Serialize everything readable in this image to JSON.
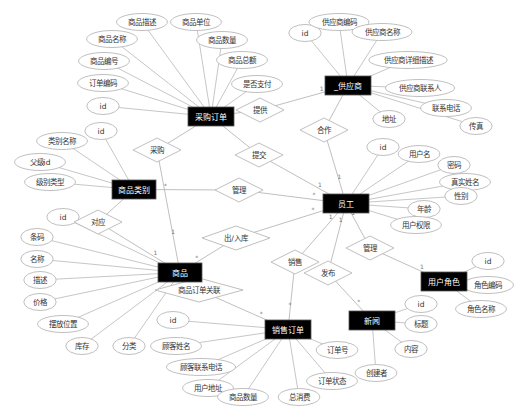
{
  "diagram": {
    "type": "er-diagram",
    "entities": [
      {
        "id": "purchase_order",
        "label": "采购订单",
        "x": 188,
        "y": 107,
        "w": 46,
        "h": 19
      },
      {
        "id": "supplier",
        "label": "_供应商",
        "x": 325,
        "y": 76,
        "w": 46,
        "h": 19
      },
      {
        "id": "category",
        "label": "商品类别",
        "x": 112,
        "y": 180,
        "w": 44,
        "h": 19
      },
      {
        "id": "employee",
        "label": "员工",
        "x": 323,
        "y": 194,
        "w": 46,
        "h": 19
      },
      {
        "id": "product",
        "label": "商品",
        "x": 158,
        "y": 263,
        "w": 44,
        "h": 19
      },
      {
        "id": "sales_order",
        "label": "销售订单",
        "x": 265,
        "y": 320,
        "w": 46,
        "h": 19
      },
      {
        "id": "news",
        "label": "新闻",
        "x": 349,
        "y": 311,
        "w": 46,
        "h": 19
      },
      {
        "id": "user_role",
        "label": "用户角色",
        "x": 421,
        "y": 272,
        "w": 46,
        "h": 19
      }
    ],
    "relationships": [
      {
        "id": "supply",
        "label": "提供",
        "x": 260,
        "y": 110
      },
      {
        "id": "cooperate",
        "label": "合作",
        "x": 324,
        "y": 130
      },
      {
        "id": "purchase",
        "label": "采购",
        "x": 157,
        "y": 150
      },
      {
        "id": "submit",
        "label": "提交",
        "x": 259,
        "y": 155
      },
      {
        "id": "manage1",
        "label": "管理",
        "x": 239,
        "y": 190
      },
      {
        "id": "correspond",
        "label": "对应",
        "x": 98,
        "y": 222
      },
      {
        "id": "stock",
        "label": "出/入库",
        "x": 236,
        "y": 238
      },
      {
        "id": "sell",
        "label": "销售",
        "x": 295,
        "y": 262
      },
      {
        "id": "publish",
        "label": "发布",
        "x": 328,
        "y": 273
      },
      {
        "id": "manage2",
        "label": "管理",
        "x": 370,
        "y": 248
      },
      {
        "id": "order_link",
        "label": "商品订单关联",
        "x": 199,
        "y": 290
      }
    ],
    "attributes": [
      {
        "entity": "purchase_order",
        "label": "商品描述",
        "x": 142,
        "y": 22
      },
      {
        "entity": "purchase_order",
        "label": "商品单位",
        "x": 196,
        "y": 22
      },
      {
        "entity": "purchase_order",
        "label": "商品名称",
        "x": 112,
        "y": 39
      },
      {
        "entity": "purchase_order",
        "label": "商品数量",
        "x": 222,
        "y": 40
      },
      {
        "entity": "purchase_order",
        "label": "商品编号",
        "x": 104,
        "y": 61
      },
      {
        "entity": "purchase_order",
        "label": "商品总额",
        "x": 242,
        "y": 60
      },
      {
        "entity": "purchase_order",
        "label": "订单编码",
        "x": 103,
        "y": 83
      },
      {
        "entity": "purchase_order",
        "label": "是否支付",
        "x": 257,
        "y": 84
      },
      {
        "entity": "purchase_order",
        "label": "id",
        "x": 103,
        "y": 106
      },
      {
        "entity": "supplier",
        "label": "id",
        "x": 305,
        "y": 33
      },
      {
        "entity": "supplier",
        "label": "供应商编码",
        "x": 339,
        "y": 22
      },
      {
        "entity": "supplier",
        "label": "供应商名称",
        "x": 382,
        "y": 32
      },
      {
        "entity": "supplier",
        "label": "供应商详细描述",
        "x": 408,
        "y": 60
      },
      {
        "entity": "supplier",
        "label": "供应商联系人",
        "x": 420,
        "y": 88
      },
      {
        "entity": "supplier",
        "label": "联系电话",
        "x": 446,
        "y": 108
      },
      {
        "entity": "supplier",
        "label": "传真",
        "x": 476,
        "y": 126
      },
      {
        "entity": "supplier",
        "label": "地址",
        "x": 389,
        "y": 119
      },
      {
        "entity": "category",
        "label": "id",
        "x": 101,
        "y": 131
      },
      {
        "entity": "category",
        "label": "类别名称",
        "x": 62,
        "y": 141
      },
      {
        "entity": "category",
        "label": "父级id",
        "x": 40,
        "y": 162
      },
      {
        "entity": "category",
        "label": "级别类型",
        "x": 50,
        "y": 182
      },
      {
        "entity": "employee",
        "label": "id",
        "x": 383,
        "y": 147
      },
      {
        "entity": "employee",
        "label": "用户名",
        "x": 419,
        "y": 154
      },
      {
        "entity": "employee",
        "label": "密码",
        "x": 454,
        "y": 165
      },
      {
        "entity": "employee",
        "label": "真实姓名",
        "x": 465,
        "y": 182
      },
      {
        "entity": "employee",
        "label": "性别",
        "x": 461,
        "y": 196
      },
      {
        "entity": "employee",
        "label": "年龄",
        "x": 424,
        "y": 209
      },
      {
        "entity": "employee",
        "label": "用户权限",
        "x": 416,
        "y": 225
      },
      {
        "entity": "product",
        "label": "id",
        "x": 63,
        "y": 217
      },
      {
        "entity": "product",
        "label": "条码",
        "x": 37,
        "y": 237
      },
      {
        "entity": "product",
        "label": "名称",
        "x": 37,
        "y": 259
      },
      {
        "entity": "product",
        "label": "描述",
        "x": 40,
        "y": 280
      },
      {
        "entity": "product",
        "label": "价格",
        "x": 40,
        "y": 302
      },
      {
        "entity": "product",
        "label": "摆放位置",
        "x": 63,
        "y": 324
      },
      {
        "entity": "product",
        "label": "库存",
        "x": 82,
        "y": 346
      },
      {
        "entity": "product",
        "label": "分类",
        "x": 129,
        "y": 346
      },
      {
        "entity": "sales_order",
        "label": "id",
        "x": 173,
        "y": 320
      },
      {
        "entity": "sales_order",
        "label": "顾客姓名",
        "x": 176,
        "y": 346
      },
      {
        "entity": "sales_order",
        "label": "顾客联系电话",
        "x": 201,
        "y": 367
      },
      {
        "entity": "sales_order",
        "label": "用户地址",
        "x": 208,
        "y": 388
      },
      {
        "entity": "sales_order",
        "label": "商品数量",
        "x": 243,
        "y": 397
      },
      {
        "entity": "sales_order",
        "label": "总消费",
        "x": 299,
        "y": 397
      },
      {
        "entity": "sales_order",
        "label": "订单号",
        "x": 337,
        "y": 350
      },
      {
        "entity": "sales_order",
        "label": "订单状态",
        "x": 332,
        "y": 381
      },
      {
        "entity": "news",
        "label": "id",
        "x": 421,
        "y": 304
      },
      {
        "entity": "news",
        "label": "标题",
        "x": 421,
        "y": 324
      },
      {
        "entity": "news",
        "label": "内容",
        "x": 411,
        "y": 349
      },
      {
        "entity": "news",
        "label": "创建者",
        "x": 376,
        "y": 373
      },
      {
        "entity": "user_role",
        "label": "id",
        "x": 488,
        "y": 261
      },
      {
        "entity": "user_role",
        "label": "角色编码",
        "x": 488,
        "y": 285
      },
      {
        "entity": "user_role",
        "label": "角色名称",
        "x": 481,
        "y": 309
      }
    ],
    "edges": [
      {
        "from": "purchase_order",
        "to": "supply",
        "from_card": "*",
        "to_card": ""
      },
      {
        "from": "supply",
        "to": "supplier",
        "from_card": "",
        "to_card": "1"
      },
      {
        "from": "supplier",
        "to": "cooperate",
        "from_card": "*",
        "to_card": ""
      },
      {
        "from": "cooperate",
        "to": "employee",
        "from_card": "",
        "to_card": "1"
      },
      {
        "from": "purchase_order",
        "to": "purchase",
        "from_card": "*",
        "to_card": ""
      },
      {
        "from": "purchase",
        "to": "product",
        "from_card": "",
        "to_card": "1"
      },
      {
        "from": "purchase_order",
        "to": "submit",
        "from_card": "*",
        "to_card": ""
      },
      {
        "from": "submit",
        "to": "employee",
        "from_card": "",
        "to_card": "1"
      },
      {
        "from": "category",
        "to": "manage1",
        "from_card": "*",
        "to_card": ""
      },
      {
        "from": "manage1",
        "to": "employee",
        "from_card": "",
        "to_card": "*"
      },
      {
        "from": "category",
        "to": "correspond",
        "from_card": "1",
        "to_card": ""
      },
      {
        "from": "correspond",
        "to": "product",
        "from_card": "",
        "to_card": "1"
      },
      {
        "from": "product",
        "to": "stock",
        "from_card": "*",
        "to_card": ""
      },
      {
        "from": "stock",
        "to": "employee",
        "from_card": "",
        "to_card": "*"
      },
      {
        "from": "employee",
        "to": "sell",
        "from_card": "1",
        "to_card": ""
      },
      {
        "from": "sell",
        "to": "sales_order",
        "from_card": "",
        "to_card": "*"
      },
      {
        "from": "employee",
        "to": "publish",
        "from_card": "1",
        "to_card": ""
      },
      {
        "from": "publish",
        "to": "news",
        "from_card": "",
        "to_card": "*"
      },
      {
        "from": "employee",
        "to": "manage2",
        "from_card": "1",
        "to_card": ""
      },
      {
        "from": "manage2",
        "to": "user_role",
        "from_card": "",
        "to_card": "1"
      },
      {
        "from": "product",
        "to": "order_link",
        "from_card": "*",
        "to_card": ""
      },
      {
        "from": "order_link",
        "to": "sales_order",
        "from_card": "",
        "to_card": "*"
      }
    ]
  },
  "colors": {
    "entity_fill": "#000000",
    "entity_text": "#ffffff",
    "stroke": "#b8b8b8",
    "text": "#333333",
    "background": "#ffffff"
  }
}
